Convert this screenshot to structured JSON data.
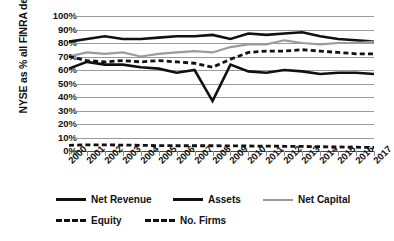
{
  "chart_data": {
    "type": "line",
    "title": "",
    "subtitle": "",
    "xlabel": "",
    "ylabel": "NYSE as % all FINRA dealers",
    "ylim": [
      0,
      100
    ],
    "ytick_labels": [
      "100%",
      "90%",
      "80%",
      "70%",
      "60%",
      "50%",
      "40%",
      "30%",
      "20%",
      "10%",
      "0%"
    ],
    "ytick_values": [
      100,
      90,
      80,
      70,
      60,
      50,
      40,
      30,
      20,
      10,
      0
    ],
    "grid": true,
    "legend_position": "bottom",
    "categories": [
      "2000",
      "2001",
      "2002",
      "2003",
      "2004",
      "2005",
      "2006",
      "2007",
      "2008",
      "2009",
      "2010",
      "2011",
      "2012",
      "2013",
      "2014",
      "2015",
      "2016",
      "2017"
    ],
    "x": [
      2000,
      2001,
      2002,
      2003,
      2004,
      2005,
      2006,
      2007,
      2008,
      2009,
      2010,
      2011,
      2012,
      2013,
      2014,
      2015,
      2016,
      2017
    ],
    "series": [
      {
        "name": "Net Revenue",
        "style": "solid",
        "color": "#111111",
        "width": 2.6,
        "values": [
          61,
          66,
          64,
          64,
          62,
          61,
          58,
          60,
          37,
          64,
          59,
          58,
          60,
          59,
          57,
          58,
          58,
          57
        ]
      },
      {
        "name": "Assets",
        "style": "solid",
        "color": "#111111",
        "width": 2.6,
        "values": [
          81,
          83,
          85,
          83,
          83,
          84,
          85,
          85,
          86,
          83,
          87,
          86,
          87,
          88,
          85,
          83,
          82,
          81
        ]
      },
      {
        "name": "Net Capital",
        "style": "solid",
        "color": "#9b9b9b",
        "width": 2.2,
        "values": [
          70,
          73,
          72,
          73,
          70,
          72,
          73,
          74,
          73,
          77,
          79,
          79,
          82,
          80,
          79,
          80,
          80,
          81
        ]
      },
      {
        "name": "Equity",
        "style": "dashed",
        "color": "#111111",
        "width": 2.8,
        "values": [
          70,
          67,
          66,
          67,
          66,
          67,
          66,
          65,
          62,
          68,
          73,
          74,
          74,
          75,
          74,
          73,
          72,
          72
        ]
      },
      {
        "name": "No. Firms",
        "style": "dashed",
        "color": "#111111",
        "width": 2.8,
        "values": [
          4.2,
          4.6,
          4.5,
          4.4,
          4.2,
          4.0,
          3.9,
          3.9,
          3.9,
          3.8,
          3.7,
          3.6,
          3.5,
          3.4,
          3.2,
          3.0,
          2.8,
          2.6
        ]
      }
    ],
    "legend": [
      {
        "label": "Net Revenue",
        "swatch": "solid-thick"
      },
      {
        "label": "Assets",
        "swatch": "solid-thick"
      },
      {
        "label": "Net Capital",
        "swatch": "solid-gray"
      },
      {
        "label": "Equity",
        "swatch": "dashed"
      },
      {
        "label": "No. Firms",
        "swatch": "dashed"
      }
    ]
  },
  "colors": {
    "grid": "#9a9a9a",
    "axis": "#4a4a4a",
    "text": "#111111",
    "net_capital": "#9b9b9b",
    "primary_line": "#111111",
    "background": "#ffffff"
  },
  "caption": ""
}
